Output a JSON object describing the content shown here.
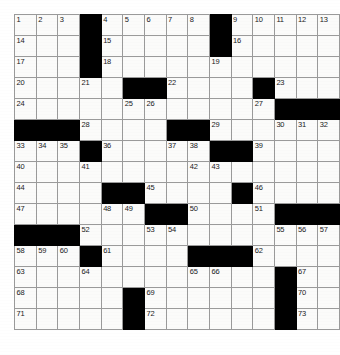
{
  "puzzle": {
    "title": "Crossword Grid",
    "columns": 13,
    "rows": 16,
    "cell_fill_color": "#fbfbfa",
    "block_color": "#000000",
    "grid_line_color": "#9a9a9a",
    "number_color": "#1a1a1a",
    "grid": [
      [
        {
          "num": "1"
        },
        {
          "num": "2"
        },
        {
          "num": "3"
        },
        {
          "block": true
        },
        {
          "num": "4"
        },
        {
          "num": "5"
        },
        {
          "num": "6"
        },
        {
          "num": "7"
        },
        {
          "num": "8"
        },
        {
          "block": true
        },
        {
          "num": "9"
        },
        {
          "num": "10"
        },
        {
          "num": "11"
        },
        {
          "num": "12"
        },
        {
          "num": "13"
        }
      ],
      [
        {
          "num": "14"
        },
        {},
        {},
        {
          "block": true
        },
        {
          "num": "15"
        },
        {},
        {},
        {},
        {},
        {
          "block": true
        },
        {
          "num": "16"
        },
        {},
        {},
        {},
        {}
      ],
      [
        {
          "num": "17"
        },
        {},
        {},
        {
          "block": true
        },
        {
          "num": "18"
        },
        {},
        {},
        {},
        {},
        {
          "num": "19"
        },
        {},
        {},
        {},
        {},
        {}
      ],
      [
        {
          "num": "20"
        },
        {},
        {},
        {
          "num": "21"
        },
        {},
        {
          "block": true
        },
        {
          "block": true
        },
        {
          "num": "22"
        },
        {},
        {},
        {},
        {
          "block": true
        },
        {
          "num": "23"
        },
        {},
        {}
      ],
      [
        {
          "num": "24"
        },
        {},
        {},
        {},
        {},
        {
          "num": "25"
        },
        {
          "num": "26"
        },
        {},
        {},
        {},
        {},
        {
          "num": "27"
        },
        {
          "block": true
        },
        {
          "block": true
        },
        {
          "block": true
        }
      ],
      [
        {
          "block": true
        },
        {
          "block": true
        },
        {
          "block": true
        },
        {
          "num": "28"
        },
        {},
        {},
        {},
        {
          "block": true
        },
        {
          "block": true
        },
        {
          "num": "29"
        },
        {},
        {},
        {
          "num": "30"
        },
        {
          "num": "31"
        },
        {
          "num": "32"
        }
      ],
      [
        {
          "num": "33"
        },
        {
          "num": "34"
        },
        {
          "num": "35"
        },
        {
          "block": true
        },
        {
          "num": "36"
        },
        {},
        {},
        {
          "num": "37"
        },
        {
          "num": "38"
        },
        {
          "block": true
        },
        {
          "block": true
        },
        {
          "num": "39"
        },
        {},
        {},
        {}
      ],
      [
        {
          "num": "40"
        },
        {},
        {},
        {
          "num": "41"
        },
        {},
        {},
        {},
        {},
        {
          "num": "42"
        },
        {
          "num": "43"
        },
        {},
        {},
        {},
        {},
        {}
      ],
      [
        {
          "num": "44"
        },
        {},
        {},
        {},
        {
          "block": true
        },
        {
          "block": true
        },
        {
          "num": "45"
        },
        {},
        {},
        {},
        {
          "block": true
        },
        {
          "num": "46"
        },
        {},
        {},
        {}
      ],
      [
        {
          "num": "47"
        },
        {},
        {},
        {},
        {
          "num": "48"
        },
        {
          "num": "49"
        },
        {
          "block": true
        },
        {
          "block": true
        },
        {
          "num": "50"
        },
        {},
        {},
        {
          "num": "51"
        },
        {
          "block": true
        },
        {
          "block": true
        },
        {
          "block": true
        }
      ],
      [
        {
          "block": true
        },
        {
          "block": true
        },
        {
          "block": true
        },
        {
          "num": "52"
        },
        {},
        {},
        {
          "num": "53"
        },
        {
          "num": "54"
        },
        {},
        {},
        {},
        {},
        {
          "num": "55"
        },
        {
          "num": "56"
        },
        {
          "num": "57"
        }
      ],
      [
        {
          "num": "58"
        },
        {
          "num": "59"
        },
        {
          "num": "60"
        },
        {
          "block": true
        },
        {
          "num": "61"
        },
        {},
        {},
        {},
        {
          "block": true
        },
        {
          "block": true
        },
        {
          "block": true
        },
        {
          "num": "62"
        },
        {},
        {},
        {}
      ],
      [
        {
          "num": "63"
        },
        {},
        {},
        {
          "num": "64"
        },
        {},
        {},
        {},
        {},
        {
          "num": "65"
        },
        {
          "num": "66"
        },
        {},
        {},
        {
          "block": true
        },
        {
          "num": "67"
        },
        {}
      ],
      [
        {
          "num": "68"
        },
        {},
        {},
        {},
        {},
        {
          "block": true
        },
        {
          "num": "69"
        },
        {},
        {},
        {},
        {},
        {},
        {
          "block": true
        },
        {
          "num": "70"
        },
        {}
      ],
      [
        {
          "num": "71"
        },
        {},
        {},
        {},
        {},
        {
          "block": true
        },
        {
          "num": "72"
        },
        {},
        {},
        {},
        {},
        {},
        {
          "block": true
        },
        {
          "num": "73"
        },
        {}
      ]
    ]
  }
}
